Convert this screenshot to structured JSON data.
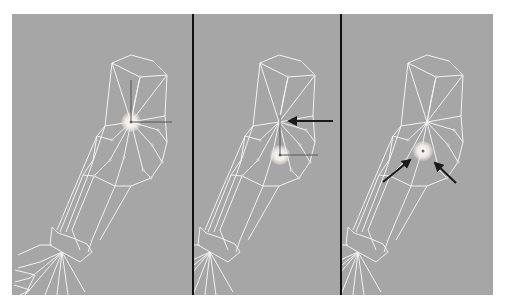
{
  "figure": {
    "background": "#ffffff",
    "viewport_color": "#a6a6a6",
    "wire_color": "#f2f2f2",
    "divider_color": "#111111",
    "arrow_color": "#1a1a1a",
    "highlight_color": "#ffffff",
    "frame": {
      "x": 12,
      "y": 14,
      "w": 481,
      "h": 281
    },
    "dividers": [
      193,
      341
    ]
  },
  "panels": [
    {
      "name": "panel-1",
      "offset_x": 0,
      "pivot": {
        "x": 131,
        "y": 122
      },
      "gizmo": {
        "origin": [
          131,
          122
        ],
        "up": [
          131,
          80
        ],
        "right": [
          172,
          122
        ]
      },
      "arrows": []
    },
    {
      "name": "panel-2",
      "offset_x": 148,
      "pivot": {
        "x": 280,
        "y": 155
      },
      "gizmo": {
        "origin": [
          280,
          155
        ],
        "up": [
          280,
          115
        ],
        "right": [
          318,
          155
        ]
      },
      "arrows": [
        {
          "from": [
            333,
            121
          ],
          "to": [
            289,
            121
          ]
        }
      ]
    },
    {
      "name": "panel-3",
      "offset_x": 296,
      "pivot": {
        "x": 423,
        "y": 151
      },
      "gizmo": null,
      "arrows": [
        {
          "from": [
            383,
            182
          ],
          "to": [
            410,
            160
          ]
        },
        {
          "from": [
            456,
            183
          ],
          "to": [
            435,
            163
          ]
        }
      ]
    }
  ]
}
